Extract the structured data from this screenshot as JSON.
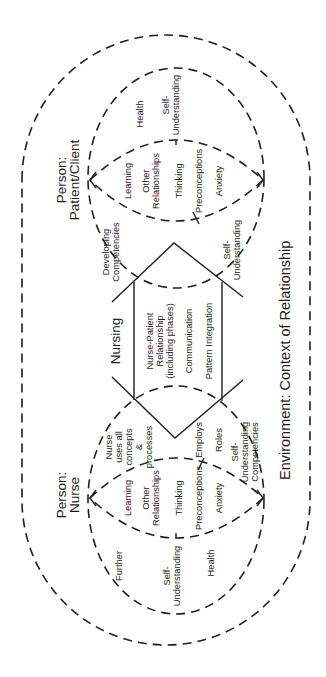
{
  "diagram": {
    "environment": {
      "label": "Environment: Context of Relationship"
    },
    "patient": {
      "title_line1": "Person:",
      "title_line2": "Patient/Client",
      "outer_items": [
        {
          "line1": "Health"
        },
        {
          "line1": "Self-",
          "line2": "Understanding"
        },
        {
          "line1": "Developing",
          "line2": "Competencies"
        },
        {
          "line1": "Self-",
          "line2": "Understanding"
        }
      ],
      "lens_items": [
        {
          "line1": "Learning"
        },
        {
          "line1": "Other",
          "line2": "Relationships"
        },
        {
          "line1": "Thinking"
        },
        {
          "line1": "Preconceptions"
        },
        {
          "line1": "Anxiety"
        }
      ]
    },
    "nursing": {
      "title": "Nursing",
      "items": [
        {
          "line1": "Nurse-Patient",
          "line2": "Relationship",
          "line3": "(including phases)"
        },
        {
          "line1": "Communication"
        },
        {
          "line1": "Pattern Integration"
        }
      ]
    },
    "nurse": {
      "title_line1": "Person:",
      "title_line2": "Nurse",
      "outer_items": [
        {
          "line1": "Nurse",
          "line2": "uses all",
          "line3": "concepts",
          "line4": "&",
          "line5": "processes"
        },
        {
          "line1": "Employs"
        },
        {
          "line1": "Roles"
        },
        {
          "line1": "Self-",
          "line2": "Understanding",
          "line3": "Competencies"
        },
        {
          "line1": "Further"
        },
        {
          "line1": "Self-",
          "line2": "Understanding"
        },
        {
          "line1": "Health"
        }
      ],
      "lens_items": [
        {
          "line1": "Learning"
        },
        {
          "line1": "Other",
          "line2": "Relationships"
        },
        {
          "line1": "Thinking"
        },
        {
          "line1": "Preconceptions"
        },
        {
          "line1": "Anxiety"
        }
      ]
    }
  }
}
